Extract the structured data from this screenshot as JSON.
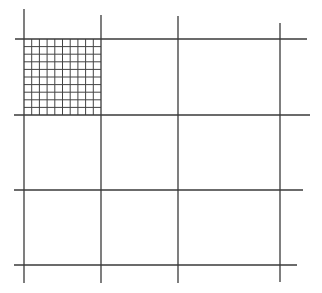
{
  "diagram": {
    "type": "grid",
    "colors": {
      "background": "#ffffff",
      "line": "#3a3a3a",
      "fine_line": "#444444"
    },
    "major_grid": {
      "vertical_lines": [
        {
          "x": 24,
          "y1": 9,
          "y2": 283
        },
        {
          "x": 101,
          "y1": 15,
          "y2": 283
        },
        {
          "x": 178,
          "y1": 16,
          "y2": 283
        },
        {
          "x": 280,
          "y1": 23,
          "y2": 282
        }
      ],
      "horizontal_lines": [
        {
          "y": 39,
          "x1": 15,
          "x2": 307
        },
        {
          "y": 115,
          "x1": 14,
          "x2": 310
        },
        {
          "y": 190,
          "x1": 14,
          "x2": 303
        },
        {
          "y": 265,
          "x1": 14,
          "x2": 297
        }
      ]
    },
    "fine_grid": {
      "cell": "top-left",
      "x0": 24,
      "y0": 39,
      "x1": 101,
      "y1": 115,
      "divisions": 10
    }
  }
}
